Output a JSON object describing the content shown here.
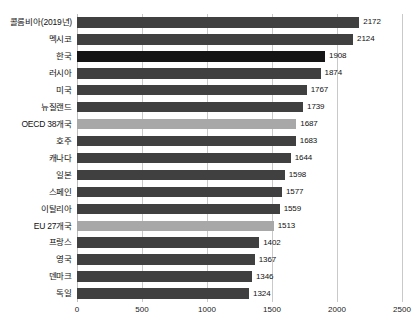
{
  "chart_data": {
    "type": "bar",
    "orientation": "horizontal",
    "title": "",
    "subtitle": "",
    "xlabel": "",
    "ylabel": "",
    "xlim": [
      0,
      2500
    ],
    "xticks": [
      0,
      500,
      1000,
      1500,
      2000,
      2500
    ],
    "xtick_labels": [
      "0",
      "500",
      "1000",
      "1500",
      "2000",
      "2500"
    ],
    "grid": true,
    "legend": "none",
    "categories": [
      "콜롬비아(2019년)",
      "멕시코",
      "한국",
      "러시아",
      "미국",
      "뉴질랜드",
      "OECD 38개국",
      "호주",
      "캐나다",
      "일본",
      "스페인",
      "이탈리아",
      "EU 27개국",
      "프랑스",
      "영국",
      "덴마크",
      "독일"
    ],
    "values": [
      2172,
      2124,
      1908,
      1874,
      1767,
      1739,
      1687,
      1683,
      1644,
      1598,
      1577,
      1559,
      1513,
      1402,
      1367,
      1346,
      1324
    ],
    "value_labels": [
      "2172",
      "2124",
      "1908",
      "1874",
      "1767",
      "1739",
      "1687",
      "1683",
      "1644",
      "1598",
      "1577",
      "1559",
      "1513",
      "1402",
      "1367",
      "1346",
      "1324"
    ],
    "bar_styles": [
      "default",
      "default",
      "primary",
      "default",
      "default",
      "default",
      "aggregate",
      "default",
      "default",
      "default",
      "default",
      "default",
      "aggregate",
      "default",
      "default",
      "default",
      "default"
    ]
  },
  "colors": {
    "bar_default": "#404040",
    "bar_primary": "#151515",
    "bar_aggregate": "#a8a8a8",
    "gridline": "#c9c9c9",
    "text": "#111111",
    "background": "#ffffff"
  }
}
